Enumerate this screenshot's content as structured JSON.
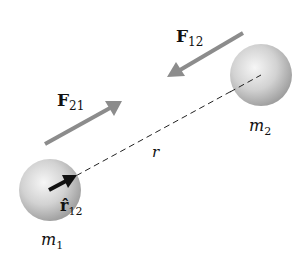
{
  "diagram": {
    "masses": [
      {
        "label": "m",
        "subscript": "1",
        "cx": 50,
        "cy": 190,
        "r": 31
      },
      {
        "label": "m",
        "subscript": "2",
        "cx": 261,
        "cy": 75,
        "r": 31
      }
    ],
    "forces": [
      {
        "label": "F",
        "subscript": "12",
        "direction": "toward m1"
      },
      {
        "label": "F",
        "subscript": "21",
        "direction": "toward m2"
      }
    ],
    "separation_label": "r",
    "unit_vector": {
      "label": "r̂",
      "subscript": "12"
    },
    "colors": {
      "force_arrow": "#8c8c8c",
      "unit_vector": "#111111",
      "sphere_light": "#f4f4f4",
      "sphere_dark": "#a8a8a8"
    }
  }
}
